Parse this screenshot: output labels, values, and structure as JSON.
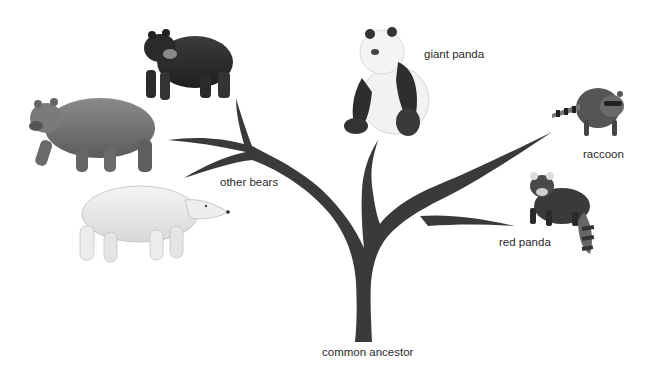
{
  "diagram": {
    "root": {
      "label": "common ancestor"
    },
    "branches": [
      {
        "id": "other-bears",
        "label": "other bears",
        "animals": [
          "black bear",
          "brown bear",
          "polar bear"
        ]
      },
      {
        "id": "giant-panda",
        "label": "giant panda",
        "animals": [
          "giant panda"
        ]
      },
      {
        "id": "raccoon",
        "label": "raccoon",
        "animals": [
          "raccoon"
        ]
      },
      {
        "id": "red-panda",
        "label": "red panda",
        "animals": [
          "red panda"
        ]
      }
    ],
    "colors": {
      "tree": "#3a3a3a",
      "text": "#2a2a2a",
      "background": "#ffffff"
    }
  }
}
